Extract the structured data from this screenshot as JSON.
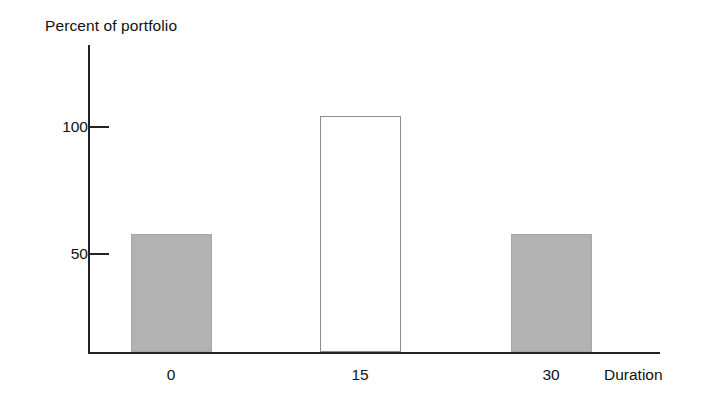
{
  "chart_data": {
    "type": "bar",
    "title": "",
    "ylabel": "Percent of portfolio",
    "xlabel": "Duration",
    "categories": [
      "0",
      "15",
      "30"
    ],
    "values": [
      50,
      100,
      50
    ],
    "series": [
      {
        "name": "Percent of portfolio",
        "values": [
          50,
          100,
          50
        ]
      }
    ],
    "ylim": [
      0,
      130
    ],
    "yticks": [
      50,
      100
    ],
    "ytick_labels": [
      "50",
      "100"
    ],
    "xtick_labels": [
      "0",
      "15",
      "30"
    ],
    "grid": false,
    "legend": null,
    "bar_styles": [
      "filled",
      "hollow",
      "filled"
    ],
    "colors": {
      "bar_fill": "#b2b2b2",
      "bar_hollow_fill": "#ffffff",
      "bar_hollow_border": "#8c8c8c",
      "axis": "#222222",
      "text": "#111111",
      "background": "#ffffff"
    }
  }
}
